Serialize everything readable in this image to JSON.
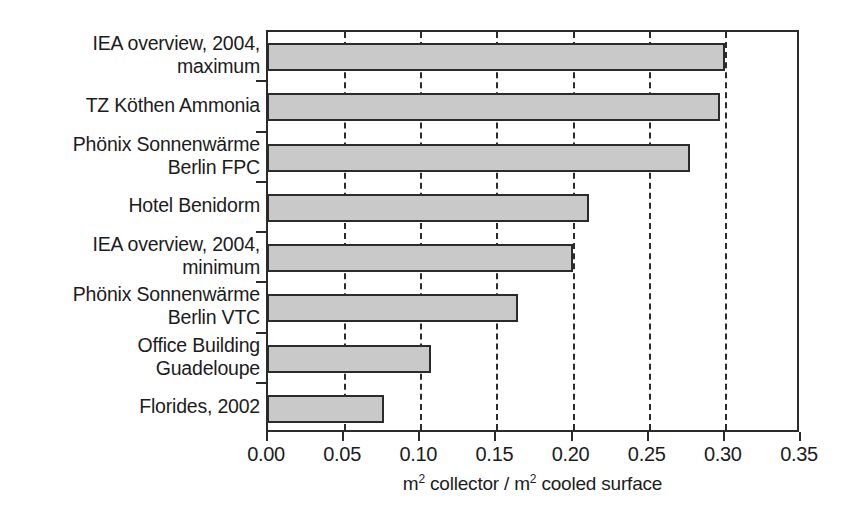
{
  "chart_data": {
    "type": "bar",
    "orientation": "horizontal",
    "title": "",
    "xlabel": "m2 collector / m2 cooled surface",
    "xlabel_parts": [
      "m",
      "2",
      " collector / m",
      "2",
      " cooled surface"
    ],
    "ylabel": "",
    "xlim": [
      0.0,
      0.35
    ],
    "xticks": [
      0.0,
      0.05,
      0.1,
      0.15,
      0.2,
      0.25,
      0.3,
      0.35
    ],
    "xtick_labels": [
      "0.00",
      "0.05",
      "0.10",
      "0.15",
      "0.20",
      "0.25",
      "0.30",
      "0.35"
    ],
    "grid": "vertical-dashed",
    "legend": "none",
    "categories": [
      "IEA overview, 2004,\nmaximum",
      "TZ Köthen Ammonia",
      "Phönix Sonnenwärme\nBerlin FPC",
      "Hotel Benidorm",
      "IEA overview, 2004,\nminimum",
      "Phönix Sonnenwärme\nBerlin VTC",
      "Office Building\nGuadeloupe",
      "Florides, 2002"
    ],
    "values": [
      0.3,
      0.297,
      0.277,
      0.211,
      0.2,
      0.164,
      0.107,
      0.076
    ],
    "bar_color": "#c9c9c9",
    "bar_edge_color": "#2b2b2b",
    "axis_color": "#2b2b2b",
    "background_color": "#ffffff"
  }
}
